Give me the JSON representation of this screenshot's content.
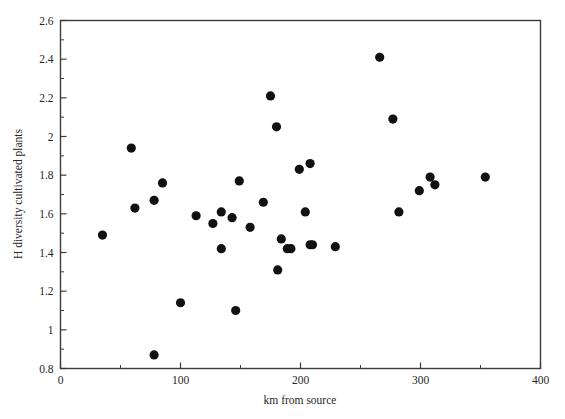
{
  "chart_data": {
    "type": "scatter",
    "title": "",
    "xlabel": "km from source",
    "ylabel": "H diversity cultivated plants",
    "xlim": [
      0,
      400
    ],
    "ylim": [
      0.8,
      2.6
    ],
    "grid": false,
    "legend": null,
    "x_major_ticks": [
      0,
      100,
      200,
      300,
      400
    ],
    "x_major_tick_labels": [
      "0",
      "100",
      "200",
      "300",
      "400"
    ],
    "x_minor_ticks": [
      50,
      150,
      250,
      350
    ],
    "y_major_ticks": [
      0.8,
      1.0,
      1.2,
      1.4,
      1.6,
      1.8,
      2.0,
      2.2,
      2.4,
      2.6
    ],
    "y_major_tick_labels": [
      "0.8",
      "1",
      "1.2",
      "1.4",
      "1.6",
      "1.8",
      "2",
      "2.2",
      "2.4",
      "2.6"
    ],
    "y_minor_ticks": [
      0.9,
      1.1,
      1.3,
      1.5,
      1.7,
      1.9,
      2.1,
      2.3,
      2.5
    ],
    "marker": "filled-circle",
    "marker_color": "#111111",
    "marker_size_px": 4.6,
    "n_points": 34,
    "x": [
      35,
      59,
      62,
      78,
      78,
      85,
      100,
      113,
      127,
      134,
      134,
      143,
      146,
      149,
      158,
      169,
      175,
      180,
      181,
      184,
      189,
      192,
      199,
      204,
      208,
      208,
      210,
      229,
      266,
      277,
      282,
      299,
      308,
      312,
      354
    ],
    "y": [
      1.49,
      1.94,
      1.63,
      1.67,
      0.87,
      1.76,
      1.14,
      1.59,
      1.55,
      1.42,
      1.61,
      1.58,
      1.1,
      1.77,
      1.53,
      1.66,
      2.21,
      2.05,
      1.31,
      1.47,
      1.42,
      1.42,
      1.83,
      1.61,
      1.86,
      1.44,
      1.44,
      1.43,
      2.41,
      2.09,
      1.61,
      1.72,
      1.79,
      1.75,
      1.79
    ],
    "points": [
      {
        "x": 35,
        "y": 1.49
      },
      {
        "x": 59,
        "y": 1.94
      },
      {
        "x": 62,
        "y": 1.63
      },
      {
        "x": 78,
        "y": 1.67
      },
      {
        "x": 78,
        "y": 0.87
      },
      {
        "x": 85,
        "y": 1.76
      },
      {
        "x": 100,
        "y": 1.14
      },
      {
        "x": 113,
        "y": 1.59
      },
      {
        "x": 127,
        "y": 1.55
      },
      {
        "x": 134,
        "y": 1.42
      },
      {
        "x": 134,
        "y": 1.61
      },
      {
        "x": 143,
        "y": 1.58
      },
      {
        "x": 146,
        "y": 1.1
      },
      {
        "x": 149,
        "y": 1.77
      },
      {
        "x": 158,
        "y": 1.53
      },
      {
        "x": 169,
        "y": 1.66
      },
      {
        "x": 175,
        "y": 2.21
      },
      {
        "x": 180,
        "y": 2.05
      },
      {
        "x": 181,
        "y": 1.31
      },
      {
        "x": 184,
        "y": 1.47
      },
      {
        "x": 189,
        "y": 1.42
      },
      {
        "x": 192,
        "y": 1.42
      },
      {
        "x": 199,
        "y": 1.83
      },
      {
        "x": 204,
        "y": 1.61
      },
      {
        "x": 208,
        "y": 1.86
      },
      {
        "x": 208,
        "y": 1.44
      },
      {
        "x": 210,
        "y": 1.44
      },
      {
        "x": 229,
        "y": 1.43
      },
      {
        "x": 266,
        "y": 2.41
      },
      {
        "x": 277,
        "y": 2.09
      },
      {
        "x": 282,
        "y": 1.61
      },
      {
        "x": 299,
        "y": 1.72
      },
      {
        "x": 308,
        "y": 1.79
      },
      {
        "x": 312,
        "y": 1.75
      },
      {
        "x": 354,
        "y": 1.79
      }
    ]
  },
  "axes": {
    "x_title": "km from source",
    "y_title": "H diversity cultivated plants"
  },
  "colors": {
    "marker": "#111111",
    "axis": "#3b3b3b",
    "text": "#262626",
    "background": "#ffffff"
  }
}
